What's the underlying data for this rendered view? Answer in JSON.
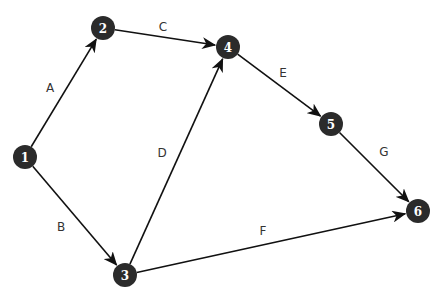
{
  "diagram": {
    "type": "directed-network",
    "colors": {
      "node_fill": "#2b2b2b",
      "node_text": "#ffffff",
      "edge": "#111111",
      "label": "#333333"
    },
    "nodes": [
      {
        "id": "1",
        "label": "1",
        "x": 25,
        "y": 157
      },
      {
        "id": "2",
        "label": "2",
        "x": 103,
        "y": 28
      },
      {
        "id": "3",
        "label": "3",
        "x": 125,
        "y": 275
      },
      {
        "id": "4",
        "label": "4",
        "x": 228,
        "y": 47
      },
      {
        "id": "5",
        "label": "5",
        "x": 331,
        "y": 124
      },
      {
        "id": "6",
        "label": "6",
        "x": 418,
        "y": 211
      }
    ],
    "edges": [
      {
        "id": "A",
        "label": "A",
        "from": "1",
        "to": "2",
        "arrow": true,
        "lx": 50,
        "ly": 88
      },
      {
        "id": "B",
        "label": "B",
        "from": "1",
        "to": "3",
        "arrow": true,
        "lx": 61,
        "ly": 227
      },
      {
        "id": "C",
        "label": "C",
        "from": "2",
        "to": "4",
        "arrow": true,
        "lx": 163,
        "ly": 27
      },
      {
        "id": "D",
        "label": "D",
        "from": "3",
        "to": "4",
        "arrow": true,
        "lx": 162,
        "ly": 153
      },
      {
        "id": "E",
        "label": "E",
        "from": "4",
        "to": "5",
        "arrow": true,
        "lx": 283,
        "ly": 73
      },
      {
        "id": "F",
        "label": "F",
        "from": "3",
        "to": "6",
        "arrow": true,
        "lx": 263,
        "ly": 231
      },
      {
        "id": "G",
        "label": "G",
        "from": "5",
        "to": "6",
        "arrow": true,
        "lx": 384,
        "ly": 152
      }
    ]
  }
}
